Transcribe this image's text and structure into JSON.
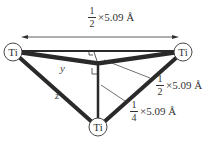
{
  "diagram": {
    "atoms": [
      {
        "label": "Ti",
        "position": "left"
      },
      {
        "label": "Ti",
        "position": "right"
      },
      {
        "label": "Ti",
        "position": "bottom"
      }
    ],
    "dimensions": {
      "top": {
        "num": "1",
        "den": "2",
        "rest": "×5.09 Å"
      },
      "right": {
        "num": "1",
        "den": "2",
        "rest": "×5.09 Å"
      },
      "bottom": {
        "num": "1",
        "den": "4",
        "rest": "×5.09 Å"
      }
    },
    "labels": {
      "y": "y",
      "z": "z"
    },
    "colors": {
      "line": "#2a2a2a",
      "text": "#333333"
    }
  }
}
